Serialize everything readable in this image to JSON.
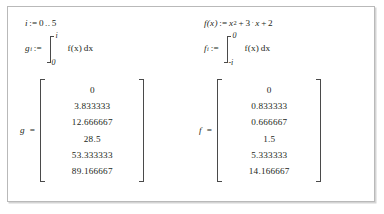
{
  "worksheet": {
    "background_color": "#ffffff",
    "border_color": "#b9b9b9",
    "text_color": "#231f20"
  },
  "left_column": {
    "range_definition": {
      "variable": "i",
      "assign_operator": ":=",
      "start": "0",
      "range_dots": "..",
      "end": "5"
    },
    "integral_definition": {
      "result_variable": "g",
      "result_subscript": "i",
      "assign_operator": ":=",
      "upper_limit": "i",
      "lower_limit": "0",
      "integrand": "f(x)",
      "differential": "dx"
    },
    "result_matrix": {
      "label": "g",
      "equals_operator": "=",
      "values": [
        "0",
        "3.833333",
        "12.666667",
        "28.5",
        "53.333333",
        "89.166667"
      ]
    }
  },
  "right_column": {
    "function_definition": {
      "name": "f(x)",
      "assign_operator": ":=",
      "term1_base": "x",
      "term1_exponent": "2",
      "plus1": "+",
      "coefficient": "3",
      "multiply_dot": "·",
      "term2_variable": "x",
      "plus2": "+",
      "constant": "2"
    },
    "integral_definition": {
      "result_variable": "f",
      "result_subscript": "i",
      "assign_operator": ":=",
      "upper_limit": "0",
      "lower_limit": "-i",
      "integrand": "f(x)",
      "differential": "dx"
    },
    "result_matrix": {
      "label": "f",
      "equals_operator": "=",
      "values": [
        "0",
        "0.833333",
        "0.666667",
        "1.5",
        "5.333333",
        "14.166667"
      ]
    }
  }
}
